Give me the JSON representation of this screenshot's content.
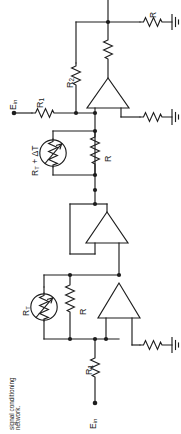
{
  "figure": {
    "kind": "circuit-schematic",
    "orientation_note": "schematic drawn rotated 90 degrees counter-clockwise on the page",
    "caption": "signal conditioning\nnetwork.",
    "caption_line1": "signal conditioning",
    "caption_line2": "network.",
    "ink_color": "#1d1d1d",
    "background_color": "#ffffff"
  },
  "labels": {
    "source_top": "E",
    "source_top_sub": "in",
    "source_bottom": "E",
    "source_bottom_sub": "in",
    "r1_top": "R",
    "r1_top_sub": "1",
    "r1_bottom": "R",
    "r1_bottom_sub": "1",
    "r2": "R",
    "r2_sub": "2",
    "r_feedback_top": "R",
    "r_bridge_top": "R",
    "r_bridge_bottom": "R",
    "thermistor_top": "R",
    "thermistor_top_sub": "T",
    "thermistor_top_suffix": " + ΔT",
    "thermistor_bottom": "R",
    "thermistor_bottom_sub": "T"
  },
  "components": [
    {
      "id": "E_in_top",
      "type": "source-terminal",
      "label": "E_in"
    },
    {
      "id": "R1_top",
      "type": "resistor",
      "label": "R₁"
    },
    {
      "id": "R2",
      "type": "resistor",
      "label": "R₂"
    },
    {
      "id": "R_fb",
      "type": "resistor",
      "label": "R"
    },
    {
      "id": "R_top_right",
      "type": "resistor",
      "label": "R"
    },
    {
      "id": "RT_plus_dT",
      "type": "thermistor",
      "label": "R_T + ΔT"
    },
    {
      "id": "R_bridge_top",
      "type": "resistor",
      "label": "R"
    },
    {
      "id": "A1",
      "type": "op-amp",
      "label": "amplifier"
    },
    {
      "id": "A2",
      "type": "op-amp",
      "label": "voltage-follower"
    },
    {
      "id": "A3",
      "type": "op-amp",
      "label": "amplifier"
    },
    {
      "id": "RT",
      "type": "thermistor",
      "label": "R_T"
    },
    {
      "id": "R_bridge_bottom",
      "type": "resistor",
      "label": "R"
    },
    {
      "id": "R1_bottom",
      "type": "resistor",
      "label": "R₁"
    },
    {
      "id": "E_in_bottom",
      "type": "source-terminal",
      "label": "E_in"
    },
    {
      "id": "GND1",
      "type": "ground"
    },
    {
      "id": "GND2",
      "type": "ground"
    },
    {
      "id": "GND3",
      "type": "ground"
    }
  ]
}
